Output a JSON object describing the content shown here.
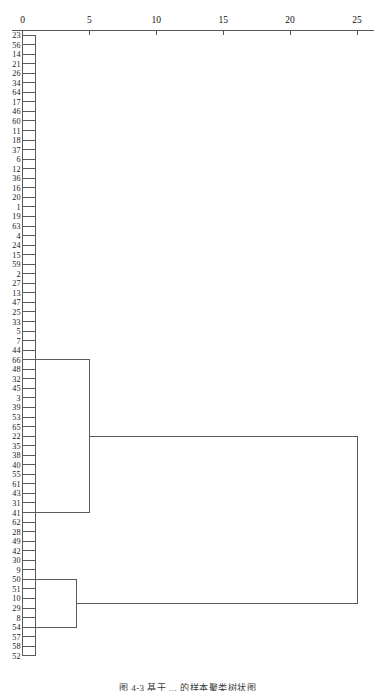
{
  "chart_data": {
    "type": "dendrogram",
    "title": "",
    "xlabel": "",
    "ylabel": "",
    "orientation": "horizontal",
    "xlim": [
      0,
      26.5
    ],
    "axis_position": "top",
    "grid": false,
    "legend": null,
    "tick_labels": [
      "0",
      "5",
      "10",
      "15",
      "20",
      "25"
    ],
    "tick_values": [
      0,
      5,
      10,
      15,
      20,
      25
    ],
    "leaf_labels": [
      "23",
      "56",
      "14",
      "21",
      "26",
      "34",
      "64",
      "17",
      "46",
      "60",
      "11",
      "18",
      "37",
      "6",
      "12",
      "36",
      "16",
      "20",
      "1",
      "19",
      "63",
      "4",
      "24",
      "15",
      "59",
      "2",
      "27",
      "13",
      "47",
      "25",
      "33",
      "5",
      "7",
      "44",
      "66",
      "48",
      "32",
      "45",
      "3",
      "39",
      "53",
      "65",
      "22",
      "35",
      "38",
      "40",
      "55",
      "61",
      "43",
      "31",
      "41",
      "62",
      "28",
      "49",
      "42",
      "30",
      "9",
      "50",
      "51",
      "10",
      "29",
      "8",
      "54",
      "57",
      "58",
      "52"
    ],
    "leaf_count": 66,
    "leaf_stub_distance": 1.0,
    "merges": [
      {
        "id": "m1",
        "label": "upper-cluster-merge",
        "distance": 5.0,
        "leaf_index_a": 34,
        "leaf_index_b": 50
      },
      {
        "id": "m2",
        "label": "lower-cluster-merge",
        "distance": 4.0,
        "leaf_index_a": 57,
        "leaf_index_b": 62
      },
      {
        "id": "m3",
        "label": "root-merge",
        "distance": 25.0,
        "child_a": "m1",
        "child_b": "m2"
      }
    ],
    "colors": {
      "link": "#5a5a5a",
      "axis": "#555555",
      "text": "#1a1a1a",
      "background": "#ffffff"
    }
  },
  "caption": {
    "text": "图 4-3  基于 ...  的样本聚类树状图"
  }
}
